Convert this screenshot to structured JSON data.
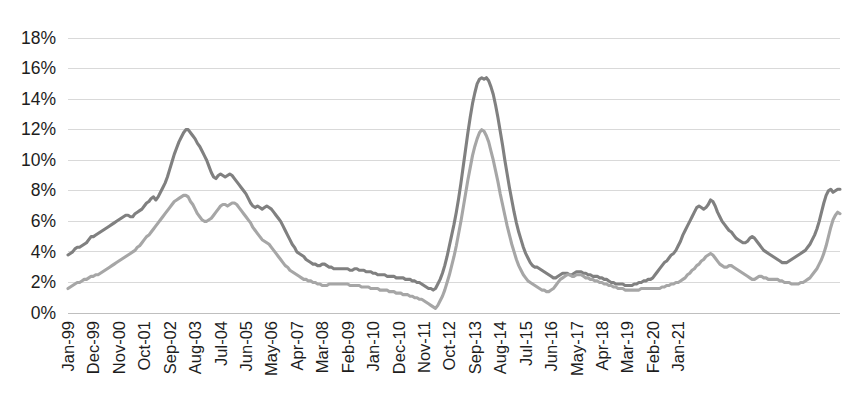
{
  "chart_data": {
    "type": "line",
    "title": "",
    "subtitle": "",
    "xlabel": "",
    "ylabel": "",
    "ylim": [
      0,
      18
    ],
    "ytick_labels": [
      "0%",
      "2%",
      "4%",
      "6%",
      "8%",
      "10%",
      "12%",
      "14%",
      "16%",
      "18%"
    ],
    "ytick_values": [
      0,
      2,
      4,
      6,
      8,
      10,
      12,
      14,
      16,
      18
    ],
    "grid": true,
    "legend": "none",
    "x_start": "Jan-99",
    "x_end": "Jan-21",
    "x_interval_months": 11,
    "tick_labels": [
      "Jan-99",
      "Dec-99",
      "Nov-00",
      "Oct-01",
      "Sep-02",
      "Aug-03",
      "Jul-04",
      "Jun-05",
      "May-06",
      "Apr-07",
      "Mar-08",
      "Feb-09",
      "Jan-10",
      "Dec-10",
      "Nov-11",
      "Oct-12",
      "Sep-13",
      "Aug-14",
      "Jul-15",
      "Jun-16",
      "May-17",
      "Apr-18",
      "Mar-19",
      "Feb-20",
      "Jan-21"
    ],
    "series": [
      {
        "name": "series-dark",
        "color": "#808080",
        "values": [
          3.8,
          3.9,
          4.0,
          4.2,
          4.3,
          4.3,
          4.4,
          4.5,
          4.6,
          4.8,
          5.0,
          5.0,
          5.1,
          5.2,
          5.3,
          5.4,
          5.5,
          5.6,
          5.7,
          5.8,
          5.9,
          6.0,
          6.1,
          6.2,
          6.3,
          6.4,
          6.4,
          6.3,
          6.3,
          6.5,
          6.6,
          6.7,
          6.8,
          7.0,
          7.2,
          7.3,
          7.5,
          7.6,
          7.4,
          7.6,
          7.9,
          8.2,
          8.5,
          8.9,
          9.4,
          9.9,
          10.4,
          10.8,
          11.2,
          11.5,
          11.8,
          12.0,
          12.0,
          11.8,
          11.6,
          11.4,
          11.1,
          10.9,
          10.6,
          10.3,
          10.0,
          9.6,
          9.2,
          8.9,
          8.8,
          9.0,
          9.1,
          9.0,
          8.9,
          9.0,
          9.1,
          9.0,
          8.8,
          8.6,
          8.4,
          8.2,
          8.0,
          7.8,
          7.5,
          7.2,
          7.0,
          6.9,
          7.0,
          6.9,
          6.8,
          6.9,
          7.0,
          6.9,
          6.8,
          6.6,
          6.4,
          6.2,
          6.0,
          5.7,
          5.4,
          5.1,
          4.8,
          4.5,
          4.3,
          4.0,
          3.9,
          3.8,
          3.7,
          3.5,
          3.4,
          3.3,
          3.2,
          3.2,
          3.1,
          3.1,
          3.2,
          3.2,
          3.1,
          3.0,
          3.0,
          2.9,
          2.9,
          2.9,
          2.9,
          2.9,
          2.9,
          2.9,
          2.8,
          2.8,
          2.9,
          2.9,
          2.8,
          2.8,
          2.8,
          2.7,
          2.7,
          2.7,
          2.6,
          2.6,
          2.5,
          2.5,
          2.5,
          2.5,
          2.4,
          2.4,
          2.4,
          2.4,
          2.3,
          2.3,
          2.3,
          2.3,
          2.2,
          2.2,
          2.2,
          2.1,
          2.1,
          2.0,
          2.0,
          1.9,
          1.8,
          1.7,
          1.6,
          1.6,
          1.5,
          1.6,
          1.9,
          2.2,
          2.6,
          3.1,
          3.7,
          4.4,
          5.1,
          5.8,
          6.6,
          7.5,
          8.5,
          9.6,
          10.7,
          11.8,
          12.8,
          13.7,
          14.4,
          15.0,
          15.3,
          15.4,
          15.3,
          15.4,
          15.2,
          14.8,
          14.3,
          13.6,
          12.8,
          11.9,
          11.0,
          10.0,
          9.1,
          8.2,
          7.4,
          6.6,
          5.9,
          5.3,
          4.8,
          4.3,
          3.9,
          3.6,
          3.3,
          3.1,
          3.0,
          3.0,
          2.9,
          2.8,
          2.7,
          2.6,
          2.5,
          2.4,
          2.3,
          2.3,
          2.4,
          2.5,
          2.6,
          2.6,
          2.6,
          2.5,
          2.5,
          2.6,
          2.7,
          2.7,
          2.7,
          2.6,
          2.6,
          2.5,
          2.5,
          2.4,
          2.4,
          2.4,
          2.3,
          2.3,
          2.2,
          2.2,
          2.1,
          2.0,
          2.0,
          1.9,
          1.9,
          1.9,
          1.9,
          1.8,
          1.8,
          1.8,
          1.8,
          1.9,
          1.9,
          2.0,
          2.0,
          2.1,
          2.1,
          2.2,
          2.2,
          2.3,
          2.5,
          2.7,
          2.9,
          3.1,
          3.3,
          3.4,
          3.6,
          3.8,
          3.9,
          4.1,
          4.4,
          4.7,
          5.1,
          5.4,
          5.7,
          6.0,
          6.3,
          6.6,
          6.9,
          7.0,
          6.9,
          6.8,
          6.9,
          7.1,
          7.4,
          7.3,
          7.0,
          6.6,
          6.3,
          6.0,
          5.8,
          5.6,
          5.4,
          5.3,
          5.1,
          4.9,
          4.8,
          4.7,
          4.6,
          4.6,
          4.7,
          4.9,
          5.0,
          4.9,
          4.7,
          4.5,
          4.3,
          4.1,
          4.0,
          3.9,
          3.8,
          3.7,
          3.6,
          3.5,
          3.4,
          3.3,
          3.3,
          3.3,
          3.4,
          3.5,
          3.6,
          3.7,
          3.8,
          3.9,
          4.0,
          4.1,
          4.3,
          4.5,
          4.8,
          5.1,
          5.5,
          6.0,
          6.6,
          7.2,
          7.7,
          8.0,
          8.1,
          7.9,
          8.0,
          8.1,
          8.1
        ]
      },
      {
        "name": "series-light",
        "color": "#a6a6a6",
        "values": [
          1.6,
          1.7,
          1.8,
          1.9,
          2.0,
          2.0,
          2.1,
          2.2,
          2.2,
          2.3,
          2.4,
          2.4,
          2.5,
          2.5,
          2.6,
          2.7,
          2.8,
          2.9,
          3.0,
          3.1,
          3.2,
          3.3,
          3.4,
          3.5,
          3.6,
          3.7,
          3.8,
          3.9,
          4.0,
          4.1,
          4.3,
          4.4,
          4.6,
          4.8,
          5.0,
          5.1,
          5.3,
          5.5,
          5.7,
          5.9,
          6.1,
          6.3,
          6.5,
          6.7,
          6.9,
          7.1,
          7.3,
          7.4,
          7.5,
          7.6,
          7.7,
          7.7,
          7.6,
          7.3,
          7.1,
          6.8,
          6.5,
          6.3,
          6.1,
          6.0,
          6.0,
          6.1,
          6.2,
          6.4,
          6.6,
          6.8,
          7.0,
          7.1,
          7.1,
          7.0,
          7.1,
          7.2,
          7.2,
          7.1,
          6.9,
          6.7,
          6.5,
          6.3,
          6.1,
          5.9,
          5.6,
          5.4,
          5.2,
          5.0,
          4.8,
          4.7,
          4.6,
          4.5,
          4.3,
          4.1,
          3.9,
          3.7,
          3.5,
          3.3,
          3.1,
          3.0,
          2.8,
          2.7,
          2.6,
          2.5,
          2.4,
          2.3,
          2.2,
          2.2,
          2.1,
          2.1,
          2.0,
          2.0,
          1.9,
          1.9,
          1.8,
          1.8,
          1.8,
          1.9,
          1.9,
          1.9,
          1.9,
          1.9,
          1.9,
          1.9,
          1.9,
          1.9,
          1.8,
          1.8,
          1.8,
          1.8,
          1.8,
          1.7,
          1.7,
          1.7,
          1.7,
          1.6,
          1.6,
          1.6,
          1.6,
          1.5,
          1.5,
          1.5,
          1.5,
          1.4,
          1.4,
          1.4,
          1.3,
          1.3,
          1.3,
          1.2,
          1.2,
          1.2,
          1.1,
          1.1,
          1.0,
          1.0,
          0.9,
          0.9,
          0.8,
          0.7,
          0.6,
          0.5,
          0.4,
          0.3,
          0.5,
          0.8,
          1.1,
          1.5,
          2.0,
          2.5,
          3.1,
          3.7,
          4.4,
          5.2,
          6.0,
          6.9,
          7.8,
          8.7,
          9.5,
          10.3,
          10.9,
          11.4,
          11.8,
          12.0,
          11.9,
          11.6,
          11.2,
          10.6,
          10.0,
          9.3,
          8.6,
          7.8,
          7.1,
          6.4,
          5.7,
          5.1,
          4.5,
          4.0,
          3.5,
          3.1,
          2.8,
          2.5,
          2.3,
          2.1,
          2.0,
          1.9,
          1.8,
          1.7,
          1.6,
          1.5,
          1.5,
          1.4,
          1.4,
          1.5,
          1.6,
          1.8,
          2.0,
          2.2,
          2.3,
          2.4,
          2.5,
          2.5,
          2.4,
          2.4,
          2.5,
          2.5,
          2.5,
          2.4,
          2.3,
          2.3,
          2.2,
          2.2,
          2.1,
          2.1,
          2.0,
          2.0,
          1.9,
          1.9,
          1.8,
          1.8,
          1.7,
          1.7,
          1.6,
          1.6,
          1.6,
          1.5,
          1.5,
          1.5,
          1.5,
          1.5,
          1.5,
          1.5,
          1.6,
          1.6,
          1.6,
          1.6,
          1.6,
          1.6,
          1.6,
          1.6,
          1.6,
          1.7,
          1.7,
          1.8,
          1.8,
          1.9,
          1.9,
          2.0,
          2.0,
          2.1,
          2.2,
          2.3,
          2.5,
          2.6,
          2.8,
          2.9,
          3.1,
          3.2,
          3.4,
          3.5,
          3.7,
          3.8,
          3.9,
          3.8,
          3.6,
          3.4,
          3.2,
          3.1,
          3.0,
          3.0,
          3.1,
          3.1,
          3.0,
          2.9,
          2.8,
          2.7,
          2.6,
          2.5,
          2.4,
          2.3,
          2.2,
          2.2,
          2.3,
          2.4,
          2.4,
          2.3,
          2.3,
          2.2,
          2.2,
          2.2,
          2.2,
          2.2,
          2.1,
          2.1,
          2.0,
          2.0,
          2.0,
          1.9,
          1.9,
          1.9,
          1.9,
          2.0,
          2.0,
          2.1,
          2.2,
          2.3,
          2.5,
          2.7,
          2.9,
          3.2,
          3.5,
          3.9,
          4.4,
          5.0,
          5.6,
          6.1,
          6.4,
          6.6,
          6.5
        ]
      }
    ]
  }
}
